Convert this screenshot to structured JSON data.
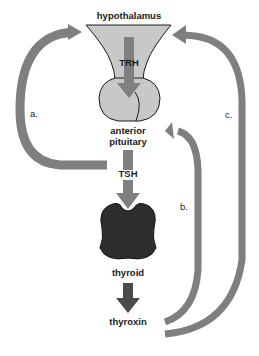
{
  "diagram": {
    "nodes": {
      "hypothalamus": "hypothalamus",
      "trh": "TRH",
      "anterior_pituitary_line1": "anterior",
      "anterior_pituitary_line2": "pituitary",
      "tsh": "TSH",
      "thyroid": "thyroid",
      "thyroxin": "thyroxin"
    },
    "feedback_loops": [
      {
        "label": "a.",
        "from": "TSH",
        "to": "hypothalamus"
      },
      {
        "label": "b.",
        "from": "thyroxin",
        "to": "anterior pituitary"
      },
      {
        "label": "c.",
        "from": "thyroxin",
        "to": "hypothalamus"
      }
    ],
    "colors": {
      "arrow_gray": "#7f7f7f",
      "gland_fill": "#c8c8c8",
      "thyroid_fill": "#2e2e2e",
      "outline": "#1a1a1a"
    }
  }
}
